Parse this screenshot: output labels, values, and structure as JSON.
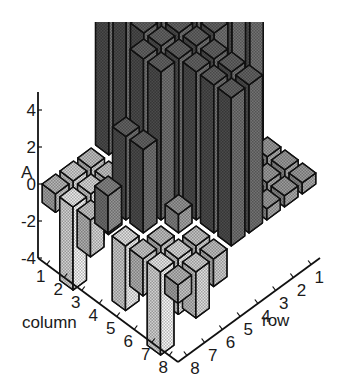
{
  "chart_data": {
    "type": "bar3d",
    "title": "",
    "zlabel": "A",
    "xlabel": "column",
    "ylabel": "row",
    "zlim": [
      -4,
      4
    ],
    "z_ticks": [
      "4",
      "2",
      "0",
      "-2",
      "-4"
    ],
    "z_tick_values": [
      4,
      2,
      0,
      -2,
      -4
    ],
    "column_ticks": [
      "1",
      "2",
      "3",
      "4",
      "5",
      "6",
      "7",
      "8"
    ],
    "row_ticks": [
      "1",
      "2",
      "3",
      "4",
      "5",
      "6",
      "7",
      "8"
    ],
    "grid": false,
    "legend": "none",
    "matrix_note": "values estimated from bar heights; bars above z=4 are clipped at top of plot",
    "values": [
      [
        0.6,
        0.6,
        0.6,
        8.0,
        8.0,
        0.6,
        0.6,
        0.6
      ],
      [
        0.6,
        0.6,
        0.6,
        8.0,
        8.0,
        0.6,
        0.6,
        0.6
      ],
      [
        0.6,
        0.6,
        1.2,
        8.0,
        8.0,
        1.2,
        0.6,
        0.6
      ],
      [
        8.0,
        8.0,
        8.0,
        8.0,
        8.0,
        8.0,
        8.0,
        8.0
      ],
      [
        8.0,
        8.0,
        8.0,
        8.0,
        8.0,
        8.0,
        8.0,
        8.0
      ],
      [
        -1.5,
        -1.8,
        1.0,
        8.0,
        8.0,
        1.0,
        -1.8,
        -1.5
      ],
      [
        -2.5,
        -3.0,
        -1.5,
        4.5,
        4.5,
        -1.5,
        -3.0,
        -2.5
      ],
      [
        -1.0,
        -4.5,
        -2.0,
        2.0,
        -3.5,
        -2.0,
        -4.5,
        -1.0
      ]
    ]
  }
}
